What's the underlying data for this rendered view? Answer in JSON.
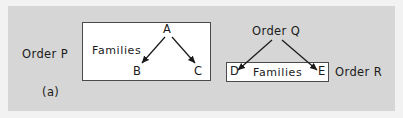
{
  "figure": {
    "caption": "(a)",
    "background_color": "#d6d6d6",
    "box_fill_color": "#ffffff",
    "box_border_color": "#4a4a4a",
    "ink_color": "#1a1a1a"
  },
  "left_diagram": {
    "order_label": "Order P",
    "box_label": "Families",
    "nodes": [
      {
        "id": "a",
        "label": "A"
      },
      {
        "id": "b",
        "label": "B"
      },
      {
        "id": "c",
        "label": "C"
      }
    ],
    "arrows": [
      {
        "from": "A",
        "to": "B"
      },
      {
        "from": "A",
        "to": "C"
      }
    ]
  },
  "right_diagram": {
    "order_source_label": "Order Q",
    "order_target_label": "Order R",
    "box_label": "Families",
    "nodes": [
      {
        "id": "d",
        "label": "D"
      },
      {
        "id": "e",
        "label": "E"
      }
    ],
    "arrows": [
      {
        "from": "Order Q",
        "to": "D"
      },
      {
        "from": "Order Q",
        "to": "E"
      }
    ]
  }
}
